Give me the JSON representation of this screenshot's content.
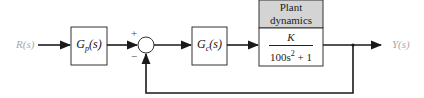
{
  "diagram": {
    "input_label": "R(s)",
    "output_label": "Y(s)",
    "prefilter": {
      "name": "G",
      "sub": "p",
      "arg": "(s)"
    },
    "summing_junction": {
      "plus_sign": "+",
      "minus_sign": "−"
    },
    "controller": {
      "name": "G",
      "sub": "c",
      "arg": "(s)"
    },
    "plant": {
      "header_line1": "Plant",
      "header_line2": "dynamics",
      "numerator": "K",
      "denominator_main": "100s",
      "denominator_exp": "2",
      "denominator_tail": " + 1"
    },
    "colors": {
      "line": "#1a1a1a",
      "header_fill": "#d4d4d4",
      "io_text": "#a8a8a8"
    }
  }
}
